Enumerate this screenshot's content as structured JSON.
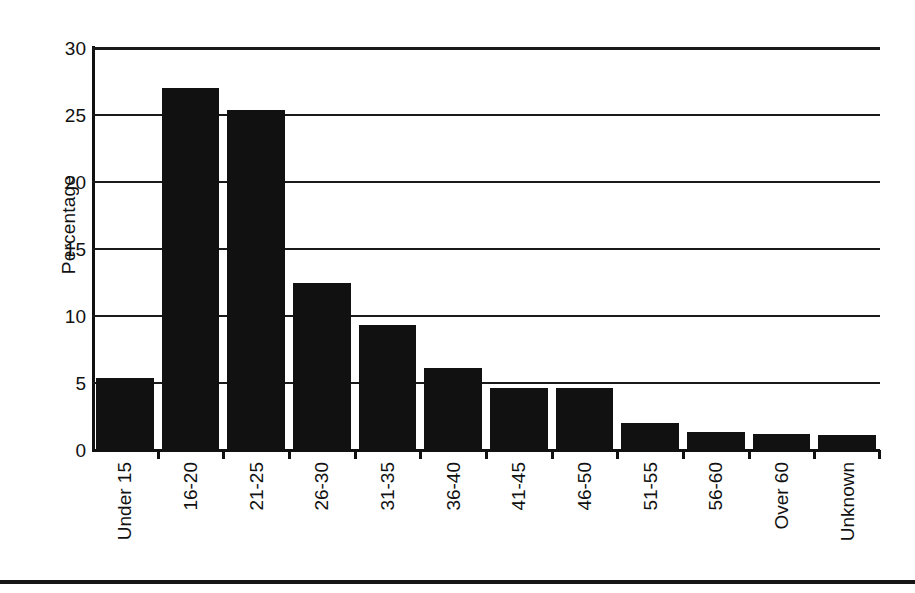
{
  "chart_data": {
    "type": "bar",
    "title": "",
    "subtitle": "",
    "xlabel": "",
    "ylabel": "Percentage",
    "categories": [
      "Under 15",
      "16-20",
      "21-25",
      "26-30",
      "31-35",
      "36-40",
      "41-45",
      "46-50",
      "51-55",
      "56-60",
      "Over 60",
      "Unknown"
    ],
    "values": [
      5.4,
      27.0,
      25.4,
      12.5,
      9.3,
      6.1,
      4.6,
      4.6,
      2.0,
      1.35,
      1.2,
      1.1
    ],
    "ylim": [
      0,
      30
    ],
    "yticks": [
      0,
      5,
      10,
      15,
      20,
      25,
      30
    ],
    "ytick_labels": [
      "0",
      "5",
      "10",
      "15",
      "20",
      "25",
      "30"
    ],
    "grid": "horizontal",
    "legend": "none",
    "bar_color": "#111111",
    "axis_color": "#111111",
    "background_color": "#ffffff",
    "xtick_label_rotation": 90
  },
  "figure": {
    "bottom_rule_color": "#161616"
  }
}
